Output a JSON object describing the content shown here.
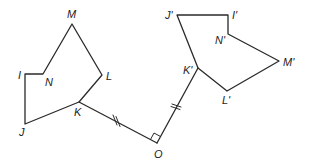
{
  "diagram": {
    "original": {
      "vertices": [
        {
          "name": "M",
          "x": 72,
          "y": 24,
          "lx": 67,
          "ly": 18
        },
        {
          "name": "L",
          "x": 102,
          "y": 75,
          "lx": 106,
          "ly": 80
        },
        {
          "name": "K",
          "x": 79,
          "y": 102,
          "lx": 74,
          "ly": 116
        },
        {
          "name": "J",
          "x": 25,
          "y": 124,
          "lx": 19,
          "ly": 136
        },
        {
          "name": "I",
          "x": 25,
          "y": 74,
          "lx": 18,
          "ly": 79
        },
        {
          "name": "N",
          "x": 43,
          "y": 74,
          "lx": 45,
          "ly": 86
        }
      ]
    },
    "image": {
      "vertices": [
        {
          "name": "J'",
          "x": 177,
          "y": 15,
          "lx": 165,
          "ly": 19
        },
        {
          "name": "I'",
          "x": 228,
          "y": 15,
          "lx": 232,
          "ly": 19
        },
        {
          "name": "N'",
          "x": 228,
          "y": 34,
          "lx": 215,
          "ly": 44
        },
        {
          "name": "M'",
          "x": 279,
          "y": 61,
          "lx": 283,
          "ly": 66
        },
        {
          "name": "L'",
          "x": 227,
          "y": 91,
          "lx": 222,
          "ly": 104
        },
        {
          "name": "K'",
          "x": 198,
          "y": 68,
          "lx": 183,
          "ly": 74
        }
      ]
    },
    "center": {
      "name": "O",
      "x": 157,
      "y": 143,
      "lx": 154,
      "ly": 158
    },
    "segments": [
      {
        "name": "OK",
        "from": "O",
        "to": "K",
        "tick_marks": 2
      },
      {
        "name": "OK'",
        "from": "O",
        "to": "K'",
        "tick_marks": 2
      }
    ],
    "angle_marker": "right-angle at O"
  }
}
